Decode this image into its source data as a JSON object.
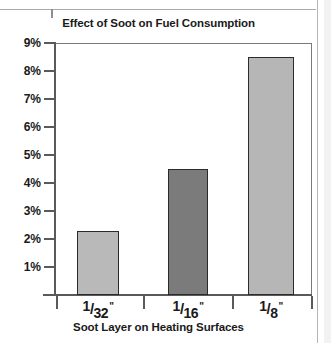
{
  "page": {
    "artifact_top_rule": "horizontal-rule",
    "artifact_right_edge": "page-edge"
  },
  "chart_data": {
    "type": "bar",
    "title": "Effect of Soot on Fuel Consumption",
    "xlabel": "Soot Layer on Heating Surfaces",
    "ylabel": "",
    "categories": [
      "1/32\"",
      "1/16\"",
      "1/8\""
    ],
    "category_parts": [
      {
        "num": "1",
        "slash": "/",
        "den": "32",
        "inch": "\""
      },
      {
        "num": "1",
        "slash": "/",
        "den": "16",
        "inch": "\""
      },
      {
        "num": "1",
        "slash": "/",
        "den": "8",
        "inch": "\""
      }
    ],
    "values": [
      2.3,
      4.5,
      8.5
    ],
    "value_labels": [
      "2.3%",
      "4.5%",
      "8.5%"
    ],
    "ylim": [
      0,
      9
    ],
    "yticks": [
      1,
      2,
      3,
      4,
      5,
      6,
      7,
      8,
      9
    ],
    "ytick_labels": [
      "1%",
      "2%",
      "3%",
      "4%",
      "5%",
      "6%",
      "7%",
      "8%",
      "9%"
    ],
    "grid": false,
    "legend": false,
    "bar_colors": [
      "#b9b9b9",
      "#7b7b7b",
      "#b6b6b6"
    ],
    "bar_edge_color": "#2b2b2b",
    "axis_color": "#5a5a5a",
    "background": "#ffffff"
  }
}
